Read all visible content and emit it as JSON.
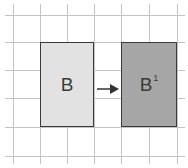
{
  "diagram": {
    "type": "grid-translation",
    "grid": {
      "vertical_lines_x": [
        13,
        40,
        67,
        94,
        121,
        149,
        177
      ],
      "horizontal_lines_y": [
        15,
        42,
        70,
        98,
        127,
        156
      ],
      "line_color": "#c4c4c4"
    },
    "shapes": [
      {
        "id": "original",
        "label": "B",
        "superscript": "",
        "fill": "#e2e2e2",
        "x": 40,
        "y": 42,
        "width": 54,
        "height": 85
      },
      {
        "id": "image",
        "label": "B",
        "superscript": "1",
        "fill": "#a6a6a6",
        "x": 121,
        "y": 42,
        "width": 56,
        "height": 85
      }
    ],
    "arrow": {
      "direction": "right",
      "from": "original",
      "to": "image",
      "color": "#333333"
    }
  }
}
